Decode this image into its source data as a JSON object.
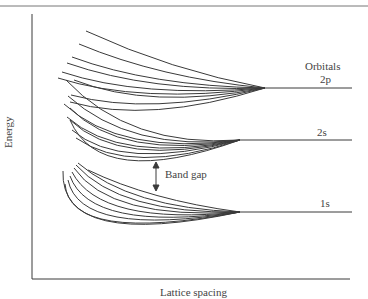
{
  "diagram": {
    "y_axis_label": "Energy",
    "x_axis_label": "Lattice spacing",
    "orbitals_header": "Orbitals",
    "levels": [
      {
        "name": "2p",
        "label": "2p",
        "y": 88,
        "converge_x": 265
      },
      {
        "name": "2s",
        "label": "2s",
        "y": 140,
        "converge_x": 240
      },
      {
        "name": "1s",
        "label": "1s",
        "y": 212,
        "converge_x": 240
      }
    ],
    "annotation": {
      "label": "Band gap",
      "arrow": "double-headed vertical arrow"
    },
    "colors": {
      "line": "#3a3a3a",
      "text": "#444444",
      "background": "#ffffff"
    }
  }
}
